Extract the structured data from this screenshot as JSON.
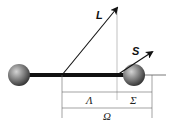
{
  "diagram": {
    "type": "Hund's case (a) angular momentum coupling in a diatomic molecule",
    "vectors": {
      "orbital": {
        "label": "L"
      },
      "spin": {
        "label": "S"
      }
    },
    "projections": {
      "lambda": {
        "label": "Λ"
      },
      "sigma": {
        "label": "Σ"
      },
      "omega": {
        "label": "Ω"
      }
    },
    "colors": {
      "line": "#111111",
      "guide": "#888888",
      "atom_light": "#bdbdbd",
      "atom_dark": "#3a3a3a"
    }
  }
}
